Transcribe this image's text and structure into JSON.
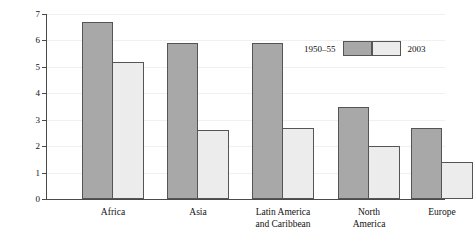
{
  "chart_data": {
    "type": "bar",
    "title": "",
    "subtitle": "",
    "xlabel": "",
    "ylabel": "Children per woman",
    "ylim": [
      0,
      7
    ],
    "ytick_labels": [
      "0",
      "1",
      "2",
      "3",
      "4",
      "5",
      "6",
      "7"
    ],
    "ytick_values": [
      0,
      1,
      2,
      3,
      4,
      5,
      6,
      7
    ],
    "grid": true,
    "legend_position": "upper-right-inside",
    "categories": [
      "Africa",
      "Asia",
      "Latin America\nand Caribbean",
      "North\nAmerica",
      "Europe"
    ],
    "series": [
      {
        "name": "1950–55",
        "color": "#a8a8a8",
        "values": [
          6.7,
          5.9,
          5.9,
          3.5,
          2.7
        ]
      },
      {
        "name": "2003",
        "color": "#ececec",
        "values": [
          5.2,
          2.6,
          2.7,
          2.0,
          1.4
        ]
      }
    ]
  },
  "axis": {
    "y_title": "Children per woman",
    "ticks": [
      {
        "label": "7",
        "value": 7
      },
      {
        "label": "6",
        "value": 6
      },
      {
        "label": "5",
        "value": 5
      },
      {
        "label": "4",
        "value": 4
      },
      {
        "label": "3",
        "value": 3
      },
      {
        "label": "2",
        "value": 2
      },
      {
        "label": "1",
        "value": 1
      },
      {
        "label": "0",
        "value": 0
      }
    ]
  },
  "legend": {
    "left_label": "1950–55",
    "right_label": "2003",
    "left_color": "#a8a8a8",
    "right_color": "#ececec"
  },
  "categories_display": [
    {
      "line1": "Africa",
      "line2": ""
    },
    {
      "line1": "Asia",
      "line2": ""
    },
    {
      "line1": "Latin America",
      "line2": "and Caribbean"
    },
    {
      "line1": "North",
      "line2": "America"
    },
    {
      "line1": "Europe",
      "line2": ""
    }
  ]
}
